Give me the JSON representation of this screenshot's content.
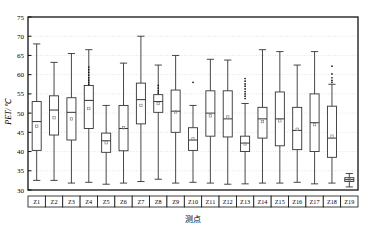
{
  "chart_data": {
    "type": "box",
    "title": "",
    "xlabel": "测点",
    "ylabel": "PET/℃",
    "ylim": [
      30,
      75
    ],
    "yticks": [
      30,
      35,
      40,
      45,
      50,
      55,
      60,
      65,
      70,
      75
    ],
    "grid": true,
    "grid_axis": "y",
    "legend": "none",
    "categories": [
      "Z1",
      "Z2",
      "Z3",
      "Z4",
      "Z5",
      "Z6",
      "Z7",
      "Z8",
      "Z9",
      "Z10",
      "Z11",
      "Z12",
      "Z13",
      "Z14",
      "Z15",
      "Z16",
      "Z17",
      "Z18",
      "Z19"
    ],
    "mean_marker": "square",
    "boxes": [
      {
        "cat": "Z1",
        "whisker_low": 32.5,
        "q1": 40.3,
        "median": 47.8,
        "q3": 53.0,
        "whisker_high": 68.0,
        "mean": 46.6,
        "outliers": []
      },
      {
        "cat": "Z2",
        "whisker_low": 32.5,
        "q1": 44.3,
        "median": 50.8,
        "q3": 54.5,
        "whisker_high": 63.2,
        "mean": 48.8,
        "outliers": []
      },
      {
        "cat": "Z3",
        "whisker_low": 31.8,
        "q1": 43.0,
        "median": 50.2,
        "q3": 54.0,
        "whisker_high": 65.5,
        "mean": 48.5,
        "outliers": []
      },
      {
        "cat": "Z4",
        "whisker_low": 32.0,
        "q1": 46.0,
        "median": 53.3,
        "q3": 57.2,
        "whisker_high": 66.5,
        "mean": 51.2,
        "outliers": [
          62.0,
          61.3,
          60.6,
          59.9,
          59.2,
          58.6,
          58.0,
          57.5
        ]
      },
      {
        "cat": "Z5",
        "whisker_low": 31.5,
        "q1": 39.8,
        "median": 42.8,
        "q3": 44.8,
        "whisker_high": 52.0,
        "mean": 42.3,
        "outliers": []
      },
      {
        "cat": "Z6",
        "whisker_low": 31.8,
        "q1": 40.2,
        "median": 46.0,
        "q3": 52.0,
        "whisker_high": 63.0,
        "mean": 46.2,
        "outliers": []
      },
      {
        "cat": "Z7",
        "whisker_low": 32.2,
        "q1": 47.2,
        "median": 53.5,
        "q3": 57.8,
        "whisker_high": 70.0,
        "mean": 52.0,
        "outliers": []
      },
      {
        "cat": "Z8",
        "whisker_low": 32.8,
        "q1": 50.2,
        "median": 53.0,
        "q3": 54.8,
        "whisker_high": 62.5,
        "mean": 52.5,
        "outliers": [
          57.2,
          56.5,
          55.8,
          55.2
        ]
      },
      {
        "cat": "Z9",
        "whisker_low": 31.8,
        "q1": 45.0,
        "median": 50.5,
        "q3": 56.0,
        "whisker_high": 65.0,
        "mean": 50.3,
        "outliers": []
      },
      {
        "cat": "Z10",
        "whisker_low": 32.0,
        "q1": 40.3,
        "median": 43.0,
        "q3": 46.2,
        "whisker_high": 52.0,
        "mean": 43.3,
        "outliers": [
          58.0
        ]
      },
      {
        "cat": "Z11",
        "whisker_low": 31.8,
        "q1": 44.0,
        "median": 50.0,
        "q3": 55.8,
        "whisker_high": 64.0,
        "mean": 49.3,
        "outliers": []
      },
      {
        "cat": "Z12",
        "whisker_low": 31.5,
        "q1": 43.8,
        "median": 48.5,
        "q3": 55.8,
        "whisker_high": 63.8,
        "mean": 49.0,
        "outliers": []
      },
      {
        "cat": "Z13",
        "whisker_low": 31.6,
        "q1": 40.0,
        "median": 42.2,
        "q3": 44.0,
        "whisker_high": 52.5,
        "mean": 42.0,
        "outliers": [
          59.0,
          58.3,
          57.6,
          57.0,
          56.3,
          55.6,
          55.0,
          54.4,
          53.8
        ]
      },
      {
        "cat": "Z14",
        "whisker_low": 31.8,
        "q1": 43.5,
        "median": 48.5,
        "q3": 51.5,
        "whisker_high": 66.5,
        "mean": 47.8,
        "outliers": []
      },
      {
        "cat": "Z15",
        "whisker_low": 31.8,
        "q1": 41.5,
        "median": 48.5,
        "q3": 55.5,
        "whisker_high": 66.0,
        "mean": 48.0,
        "outliers": []
      },
      {
        "cat": "Z16",
        "whisker_low": 32.0,
        "q1": 40.5,
        "median": 45.5,
        "q3": 51.5,
        "whisker_high": 62.5,
        "mean": 45.8,
        "outliers": []
      },
      {
        "cat": "Z17",
        "whisker_low": 31.6,
        "q1": 40.0,
        "median": 47.5,
        "q3": 55.0,
        "whisker_high": 66.0,
        "mean": 47.0,
        "outliers": []
      },
      {
        "cat": "Z18",
        "whisker_low": 31.8,
        "q1": 38.5,
        "median": 43.5,
        "q3": 51.8,
        "whisker_high": 57.5,
        "mean": 44.0,
        "outliers": [
          62.2,
          60.2,
          59.2,
          58.5,
          58.0
        ]
      },
      {
        "cat": "Z19",
        "whisker_low": 30.8,
        "q1": 32.2,
        "median": 32.7,
        "q3": 33.2,
        "whisker_high": 34.3,
        "mean": 32.7,
        "outliers": []
      }
    ]
  },
  "style": {
    "line_color": "#333333",
    "box_fill": "#ffffff",
    "grid_color": "#cccccc",
    "frame_color": "#111111",
    "mean_color": "#888888"
  }
}
